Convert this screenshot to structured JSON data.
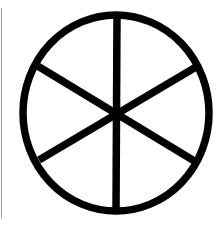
{
  "symbol": {
    "name": "six-spoke wheel",
    "stroke_color": "#000000",
    "background": "#ffffff",
    "edge_line_color": "#9a9a9a"
  }
}
